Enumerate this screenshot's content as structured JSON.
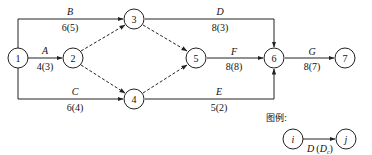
{
  "diagram": {
    "type": "activity-on-arrow network",
    "nodes": [
      {
        "id": "1",
        "label": "1",
        "cx": 18,
        "cy": 58
      },
      {
        "id": "2",
        "label": "2",
        "cx": 73,
        "cy": 58
      },
      {
        "id": "3",
        "label": "3",
        "cx": 134,
        "cy": 19
      },
      {
        "id": "4",
        "label": "4",
        "cx": 134,
        "cy": 99
      },
      {
        "id": "5",
        "label": "5",
        "cx": 196,
        "cy": 58
      },
      {
        "id": "6",
        "label": "6",
        "cx": 274,
        "cy": 58
      },
      {
        "id": "7",
        "label": "7",
        "cx": 345,
        "cy": 58
      }
    ],
    "activities": [
      {
        "from": "1",
        "to": "3",
        "name": "B",
        "duration": "6(5)"
      },
      {
        "from": "1",
        "to": "2",
        "name": "A",
        "duration": "4(3)"
      },
      {
        "from": "1",
        "to": "4",
        "name": "C",
        "duration": "6(4)"
      },
      {
        "from": "3",
        "to": "6",
        "name": "D",
        "duration": "8(3)"
      },
      {
        "from": "5",
        "to": "6",
        "name": "F",
        "duration": "8(8)"
      },
      {
        "from": "4",
        "to": "6",
        "name": "E",
        "duration": "5(2)"
      },
      {
        "from": "6",
        "to": "7",
        "name": "G",
        "duration": "8(7)"
      }
    ],
    "dummy_activities": [
      {
        "from": "2",
        "to": "3"
      },
      {
        "from": "2",
        "to": "4"
      },
      {
        "from": "3",
        "to": "5"
      },
      {
        "from": "4",
        "to": "5"
      }
    ]
  },
  "labels": {
    "n1": "1",
    "n2": "2",
    "n3": "3",
    "n4": "4",
    "n5": "5",
    "n6": "6",
    "n7": "7",
    "B_name": "B",
    "B_dur": "6(5)",
    "A_name": "A",
    "A_dur": "4(3)",
    "C_name": "C",
    "C_dur": "6(4)",
    "D_name": "D",
    "D_dur": "8(3)",
    "F_name": "F",
    "F_dur": "8(8)",
    "E_name": "E",
    "E_dur": "5(2)",
    "G_name": "G",
    "G_dur": "8(7)"
  },
  "legend": {
    "title": "图例:",
    "node_i": "i",
    "node_j": "j",
    "arrow_label_main": "D",
    "arrow_label_paren_open": "(",
    "arrow_label_sub_base": "D",
    "arrow_label_sub": "c",
    "arrow_label_paren_close": ")"
  }
}
